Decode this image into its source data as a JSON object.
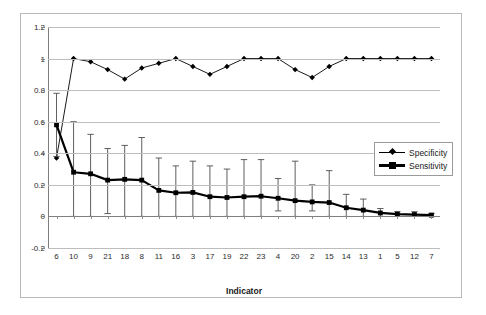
{
  "chart_data": {
    "type": "line",
    "title": "",
    "xlabel": "Indicator",
    "ylabel": "",
    "ylim": [
      -0.2,
      1.2
    ],
    "yticks": [
      "1.2",
      "1",
      "0.8",
      "0.6",
      "0.4",
      "0.2",
      "0",
      "-0.2"
    ],
    "ytick_values": [
      1.2,
      1,
      0.8,
      0.6,
      0.4,
      0.2,
      0,
      -0.2
    ],
    "grid": true,
    "legend_position": "middle-right",
    "categories": [
      "6",
      "10",
      "9",
      "21",
      "18",
      "8",
      "11",
      "16",
      "3",
      "17",
      "19",
      "22",
      "23",
      "4",
      "20",
      "2",
      "15",
      "14",
      "13",
      "1",
      "5",
      "12",
      "7"
    ],
    "series": [
      {
        "name": "Specificity",
        "marker": "diamond",
        "line_width": "thin",
        "values": [
          0.37,
          1.0,
          0.98,
          0.93,
          0.87,
          0.94,
          0.97,
          1.0,
          0.95,
          0.9,
          0.95,
          1.0,
          1.0,
          1.0,
          0.93,
          0.88,
          0.95,
          1.0,
          1.0,
          1.0,
          1.0,
          1.0,
          1.0
        ],
        "error_bars": false
      },
      {
        "name": "Sensitivity",
        "marker": "square",
        "line_width": "thick",
        "values": [
          0.58,
          0.28,
          0.27,
          0.23,
          0.235,
          0.23,
          0.165,
          0.15,
          0.152,
          0.125,
          0.12,
          0.125,
          0.128,
          0.115,
          0.1,
          0.092,
          0.088,
          0.055,
          0.04,
          0.022,
          0.015,
          0.012,
          0.008
        ],
        "error_low": [
          0.38,
          0.0,
          0.0,
          0.018,
          0.0,
          0.0,
          0.0,
          0.0,
          0.0,
          0.0,
          0.0,
          0.0,
          0.0,
          0.035,
          0.0,
          0.035,
          0.0,
          0.0,
          0.0,
          0.0,
          0.0,
          0.0,
          0.0
        ],
        "error_high": [
          0.78,
          0.6,
          0.52,
          0.43,
          0.45,
          0.5,
          0.37,
          0.32,
          0.35,
          0.32,
          0.3,
          0.36,
          0.36,
          0.24,
          0.35,
          0.2,
          0.29,
          0.14,
          0.11,
          0.05,
          0.03,
          0.03,
          0.02
        ],
        "error_bars": true
      }
    ]
  },
  "legend": {
    "items": [
      {
        "label": "Specificity"
      },
      {
        "label": "Sensitivity"
      }
    ]
  },
  "colors": {
    "series": "#000000",
    "gridline": "#bdbdbd",
    "axis": "#808080",
    "frame": "#b9b9b9",
    "text": "#1a1a1a"
  }
}
